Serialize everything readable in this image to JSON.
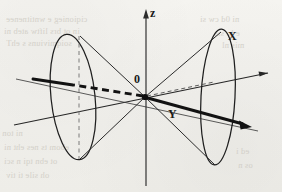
{
  "figure": {
    "kind": "double-cone-diagram",
    "background_color": "#f3f2ee",
    "ink_color": "#1b1b1b",
    "labels": {
      "origin": "0",
      "z_axis": "z",
      "y_axis_lower": "y",
      "x_axis_lower": "x",
      "X_axis_upper": "X",
      "Y_axis_upper": "Y"
    },
    "axes": [
      {
        "name": "z-axis",
        "label": "z",
        "style": "thin-solid",
        "arrow": true
      },
      {
        "name": "y-axis",
        "label": "y",
        "style": "thin-solid",
        "arrow": true
      },
      {
        "name": "x-axis",
        "label": "x",
        "style": "thin-solid",
        "arrow": false
      },
      {
        "name": "X-axis-boosted",
        "label": "x",
        "style": "thick-solid",
        "arrow": true
      },
      {
        "name": "X-axis-hidden",
        "label": "",
        "style": "thick-dashed",
        "arrow": false
      },
      {
        "name": "Y-axis-hidden",
        "label": "",
        "style": "thin-dashed",
        "arrow": false
      }
    ],
    "ghost_text": [
      {
        "text": "ciqionieg e wntitnenee",
        "x": 6,
        "y": 14
      },
      {
        "text": "in ot brs liftw ateb ni",
        "x": 4,
        "y": 26
      },
      {
        "text": "soiqmiviuns s ehT",
        "x": 6,
        "y": 38
      },
      {
        "text": "ni 0d cw si",
        "x": 200,
        "y": 14
      },
      {
        "text": "e lo sia",
        "x": 214,
        "y": 28
      },
      {
        "text": "mis nl",
        "x": 222,
        "y": 40
      },
      {
        "text": "ni ton",
        "x": 2,
        "y": 128
      },
      {
        "text": "ebom ts nes eht ni",
        "x": 4,
        "y": 142
      },
      {
        "text": "ot ebn tqi n sci",
        "x": 4,
        "y": 156
      },
      {
        "text": "oh sile ti tiv",
        "x": 6,
        "y": 170
      },
      {
        "text": "ed i",
        "x": 236,
        "y": 146
      },
      {
        "text": "os n",
        "x": 238,
        "y": 160
      }
    ]
  }
}
